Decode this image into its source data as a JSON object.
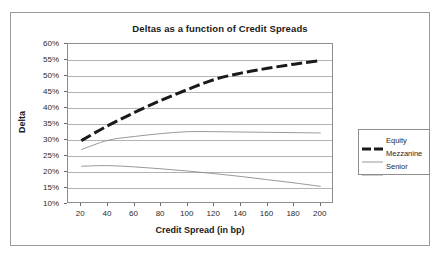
{
  "chart_data": {
    "type": "line",
    "title": "Deltas as a function of Credit Spreads",
    "xlabel": "Credit Spread (in bp)",
    "ylabel": "Delta",
    "xlim": [
      10,
      210
    ],
    "ylim": [
      10,
      60
    ],
    "grid": true,
    "legend_position": "right",
    "x_tick_labels": [
      "20",
      "40",
      "60",
      "80",
      "100",
      "120",
      "140",
      "160",
      "180",
      "200"
    ],
    "x_ticks": [
      20,
      40,
      60,
      80,
      100,
      120,
      140,
      160,
      180,
      200
    ],
    "y_tick_labels": [
      "60%",
      "55%",
      "50%",
      "45%",
      "40%",
      "35%",
      "30%",
      "25%",
      "20%",
      "15%",
      "10%"
    ],
    "y_ticks": [
      60,
      55,
      50,
      45,
      40,
      35,
      30,
      25,
      20,
      15,
      10
    ],
    "x": [
      20,
      40,
      60,
      80,
      100,
      120,
      140,
      160,
      180,
      200
    ],
    "series": [
      {
        "name": "Equity",
        "style": "thick-dashed",
        "color": "#1a1a1a",
        "values": [
          29.8,
          34.5,
          38.6,
          42.4,
          45.8,
          48.9,
          50.9,
          52.4,
          53.7,
          54.8
        ]
      },
      {
        "name": "Mezzanine",
        "style": "thin-solid",
        "color": "#8c8c8c",
        "values": [
          27.0,
          29.9,
          31.1,
          32.0,
          32.6,
          32.6,
          32.5,
          32.4,
          32.3,
          32.2
        ]
      },
      {
        "name": "Senior",
        "style": "thin-solid",
        "color": "#8c8c8c",
        "values": [
          21.8,
          22.0,
          21.6,
          21.0,
          20.3,
          19.5,
          18.6,
          17.6,
          16.6,
          15.5
        ]
      }
    ]
  },
  "legend": {
    "items": [
      {
        "label": "Equity"
      },
      {
        "label": "Mezzanine"
      },
      {
        "label": "Senior"
      }
    ]
  }
}
